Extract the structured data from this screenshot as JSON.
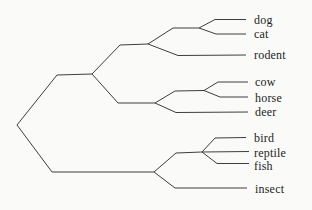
{
  "figure": {
    "type": "cladogram",
    "background_color": "#fafaf8",
    "branch_color": "#3e3e3e",
    "label_color": "#1e1e1e",
    "topology_newick": "((((dog,cat),rodent),((cow,horse),deer)),((bird,reptile,fish),insect))"
  },
  "tree": {
    "leaves": [
      {
        "label": "dog",
        "label_x": 254,
        "label_y": 19.5
      },
      {
        "label": "cat",
        "label_x": 254,
        "label_y": 33.5
      },
      {
        "label": "rodent",
        "label_x": 254,
        "label_y": 55
      },
      {
        "label": "cow",
        "label_x": 255,
        "label_y": 82
      },
      {
        "label": "horse",
        "label_x": 255,
        "label_y": 97.5
      },
      {
        "label": "deer",
        "label_x": 255,
        "label_y": 112
      },
      {
        "label": "bird",
        "label_x": 254,
        "label_y": 138
      },
      {
        "label": "reptile",
        "label_x": 254,
        "label_y": 152.5
      },
      {
        "label": "fish",
        "label_x": 254,
        "label_y": 165.5
      },
      {
        "label": "insect",
        "label_x": 255,
        "label_y": 189
      }
    ],
    "branches": [
      {
        "name": "root-to-mammal-clade",
        "points": [
          [
            17,
            125
          ],
          [
            57,
            75
          ],
          [
            92,
            74
          ]
        ]
      },
      {
        "name": "mammal-to-dogcat-rodent-clade",
        "points": [
          [
            92,
            74
          ],
          [
            120,
            45
          ],
          [
            148,
            44
          ]
        ]
      },
      {
        "name": "dogcatrodent-to-dogcat-node",
        "points": [
          [
            148,
            44
          ],
          [
            173,
            28
          ],
          [
            199,
            28
          ]
        ]
      },
      {
        "name": "dog-branch",
        "points": [
          [
            199,
            28
          ],
          [
            215,
            19.5
          ],
          [
            246,
            19.5
          ]
        ]
      },
      {
        "name": "cat-branch",
        "points": [
          [
            199,
            28
          ],
          [
            216,
            34
          ],
          [
            246,
            34
          ]
        ]
      },
      {
        "name": "rodent-branch",
        "points": [
          [
            148,
            44
          ],
          [
            178,
            55.5
          ],
          [
            246,
            55
          ]
        ]
      },
      {
        "name": "mammal-to-ungulate-clade",
        "points": [
          [
            92,
            74
          ],
          [
            118,
            103
          ],
          [
            155,
            103
          ]
        ]
      },
      {
        "name": "ungulate-to-cowhorse-node",
        "points": [
          [
            155,
            103
          ],
          [
            175,
            91
          ],
          [
            204,
            90.5
          ]
        ]
      },
      {
        "name": "cow-branch",
        "points": [
          [
            204,
            90.5
          ],
          [
            218,
            82
          ],
          [
            248,
            82
          ]
        ]
      },
      {
        "name": "horse-branch",
        "points": [
          [
            204,
            90.5
          ],
          [
            220,
            97
          ],
          [
            248,
            97
          ]
        ]
      },
      {
        "name": "deer-branch",
        "points": [
          [
            155,
            103
          ],
          [
            176,
            112.5
          ],
          [
            248,
            112
          ]
        ]
      },
      {
        "name": "root-to-lower-clade",
        "points": [
          [
            17,
            125
          ],
          [
            52,
            172
          ],
          [
            154,
            172
          ]
        ]
      },
      {
        "name": "lower-to-birdreptilefish-node",
        "points": [
          [
            154,
            172
          ],
          [
            176,
            153
          ],
          [
            202,
            152
          ]
        ]
      },
      {
        "name": "bird-branch",
        "points": [
          [
            202,
            152
          ],
          [
            215,
            138
          ],
          [
            246,
            137.5
          ]
        ]
      },
      {
        "name": "reptile-branch",
        "points": [
          [
            202,
            152
          ],
          [
            249,
            151.5
          ]
        ]
      },
      {
        "name": "fish-branch",
        "points": [
          [
            202,
            152
          ],
          [
            217,
            163.5
          ],
          [
            249,
            163.5
          ]
        ]
      },
      {
        "name": "insect-branch",
        "points": [
          [
            154,
            172
          ],
          [
            175,
            188
          ],
          [
            247,
            188
          ]
        ]
      }
    ]
  }
}
